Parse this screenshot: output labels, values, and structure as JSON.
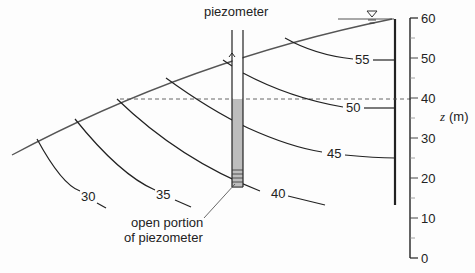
{
  "labels": {
    "piezometer": "piezometer",
    "open_portion_line1": "open portion",
    "open_portion_line2": "of piezometer",
    "z_axis_var": "z",
    "z_axis_unit": "(m)"
  },
  "equipotentials": [
    {
      "value": "30"
    },
    {
      "value": "35"
    },
    {
      "value": "40"
    },
    {
      "value": "45"
    },
    {
      "value": "50"
    },
    {
      "value": "55"
    }
  ],
  "axis": {
    "ticks": [
      "60",
      "50",
      "40",
      "30",
      "20",
      "10",
      "0"
    ],
    "range": [
      0,
      60
    ]
  },
  "piezometer_water_level_z": 40,
  "water_table_symbol": "inverted-triangle",
  "colors": {
    "line": "#222222",
    "ground": "#555555",
    "shade": "#bdbdbd",
    "background": "#fdfdfd"
  }
}
